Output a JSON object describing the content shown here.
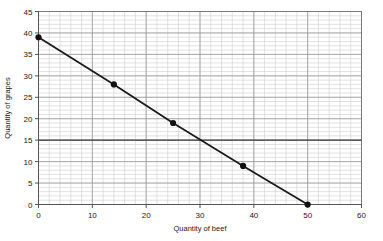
{
  "chart_data": {
    "type": "line",
    "title": "",
    "subtitle": "",
    "xlabel": "Quantity of beef",
    "ylabel": "Quantity of grapes",
    "xlim": [
      0,
      60
    ],
    "ylim": [
      0,
      45
    ],
    "xticks": [
      0,
      10,
      20,
      30,
      40,
      50,
      60
    ],
    "yticks": [
      0,
      5,
      10,
      15,
      20,
      25,
      30,
      35,
      40,
      45
    ],
    "xtick_labels": [
      "0",
      "10",
      "20",
      "30",
      "40",
      "50",
      "60"
    ],
    "ytick_labels": [
      "0",
      "5",
      "10",
      "15",
      "20",
      "25",
      "30",
      "35",
      "40",
      "45"
    ],
    "grid": true,
    "grid_minor_x_step": 2,
    "grid_minor_y_step": 1,
    "grid_major_x_step": 10,
    "grid_major_y_step": 5,
    "legend": null,
    "legend_position": "none",
    "series": [
      {
        "name": "Budget line",
        "marker": "filled-circle",
        "x": [
          0,
          14,
          25,
          38,
          50
        ],
        "values": [
          39,
          28,
          19,
          9,
          0
        ],
        "points": [
          {
            "x": 0,
            "y": 39
          },
          {
            "x": 14,
            "y": 28
          },
          {
            "x": 25,
            "y": 19
          },
          {
            "x": 38,
            "y": 9
          },
          {
            "x": 50,
            "y": 0
          }
        ]
      }
    ],
    "annotations": [
      {
        "type": "horizontal-reference-line",
        "y": 15,
        "label": ""
      }
    ],
    "colors": {
      "line": "#1a1a1a",
      "marker": "#111111",
      "reference_line": "#3a3a3a",
      "grid_minor": "#cfcfcf",
      "grid_major": "#9a9a9a",
      "axis": "#555555",
      "plot_border": "#7a7a7a",
      "text": "#1a1a1a",
      "background": "#ffffff"
    }
  }
}
